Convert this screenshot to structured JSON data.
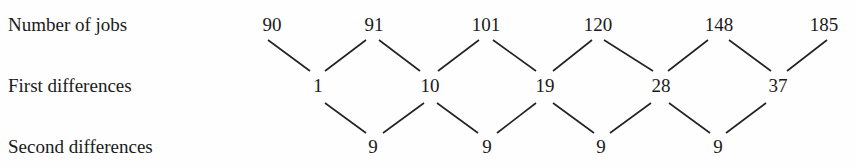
{
  "labels": {
    "row1": "Number of jobs",
    "row2": "First differences",
    "row3": "Second differences"
  },
  "number_of_jobs": [
    "90",
    "91",
    "101",
    "120",
    "148",
    "185"
  ],
  "first_differences": [
    "1",
    "10",
    "19",
    "28",
    "37"
  ],
  "second_differences": [
    "9",
    "9",
    "9",
    "9"
  ]
}
